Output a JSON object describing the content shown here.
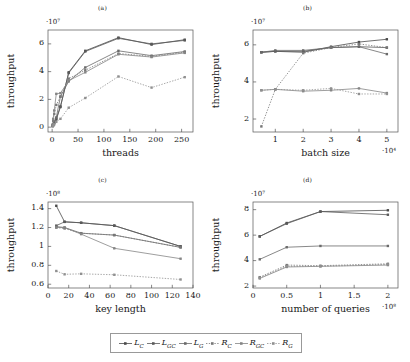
{
  "figure": {
    "ylabel": "throughput",
    "legend": {
      "items": [
        {
          "name": "L_C",
          "base": "L",
          "sub": "C",
          "color": "#4a4a4a",
          "dash": "none",
          "marker": "square"
        },
        {
          "name": "L_GC",
          "base": "L",
          "sub": "GC",
          "color": "#5a5a5a",
          "dash": "none",
          "marker": "square"
        },
        {
          "name": "L_G",
          "base": "L",
          "sub": "G",
          "color": "#6a6a6a",
          "dash": "none",
          "marker": "square"
        },
        {
          "name": "R_C",
          "base": "R",
          "sub": "C",
          "color": "#777777",
          "dash": "dotted",
          "marker": "square"
        },
        {
          "name": "R_GC",
          "base": "R",
          "sub": "GC",
          "color": "#858585",
          "dash": "none",
          "marker": "square"
        },
        {
          "name": "R_G",
          "base": "R",
          "sub": "G",
          "color": "#909090",
          "dash": "dotted",
          "marker": "square"
        }
      ]
    }
  },
  "chart_data": [
    {
      "id": "a",
      "type": "line",
      "title": "(a)",
      "xlabel": "threads",
      "ylabel": "throughput",
      "x_multiplier": "",
      "y_multiplier": "·10⁷",
      "xlim": [
        -8,
        272
      ],
      "ylim": [
        -0.35,
        7.0
      ],
      "xticks": [
        0,
        50,
        100,
        150,
        200,
        250
      ],
      "yticks": [
        0,
        2,
        4,
        6
      ],
      "x": [
        1,
        2,
        4,
        8,
        16,
        32,
        64,
        128,
        192,
        256
      ],
      "series": [
        {
          "name": "L_C",
          "values": [
            0.08,
            0.14,
            0.28,
            0.55,
            1.45,
            3.95,
            5.5,
            6.45,
            5.95,
            6.3
          ]
        },
        {
          "name": "L_GC",
          "values": [
            0.1,
            0.18,
            0.33,
            0.62,
            1.5,
            3.9,
            5.45,
            6.4,
            6.0,
            6.25
          ]
        },
        {
          "name": "L_G",
          "values": [
            0.12,
            0.2,
            0.4,
            0.7,
            2.2,
            3.3,
            4.3,
            5.5,
            5.15,
            5.45
          ]
        },
        {
          "name": "R_C",
          "values": [
            0.15,
            0.45,
            0.95,
            1.6,
            2.2,
            3.5,
            4.1,
            5.3,
            5.1,
            5.4
          ]
        },
        {
          "name": "R_GC",
          "values": [
            0.2,
            0.6,
            1.2,
            2.4,
            2.45,
            3.35,
            3.95,
            5.25,
            5.05,
            5.35
          ]
        },
        {
          "name": "R_G",
          "values": [
            0.05,
            0.1,
            0.2,
            0.38,
            0.6,
            1.4,
            2.1,
            3.65,
            2.85,
            3.6
          ]
        }
      ]
    },
    {
      "id": "b",
      "type": "line",
      "title": "(b)",
      "xlabel": "batch size",
      "ylabel": "throughput",
      "x_multiplier": "·10⁴",
      "y_multiplier": "·10⁷",
      "xlim": [
        0.2,
        5.4
      ],
      "ylim": [
        1.3,
        6.8
      ],
      "xticks": [
        1,
        2,
        3,
        4,
        5
      ],
      "yticks": [
        2,
        4,
        6
      ],
      "x": [
        0.5,
        1,
        2,
        3,
        4,
        5
      ],
      "series": [
        {
          "name": "L_C",
          "values": [
            5.6,
            5.65,
            5.6,
            5.9,
            6.15,
            6.3
          ]
        },
        {
          "name": "L_GC",
          "values": [
            5.6,
            5.65,
            5.65,
            5.85,
            5.9,
            5.85
          ]
        },
        {
          "name": "L_G",
          "values": [
            5.6,
            5.7,
            5.7,
            5.85,
            5.9,
            5.5
          ]
        },
        {
          "name": "R_C",
          "values": [
            1.6,
            3.6,
            5.55,
            5.85,
            6.05,
            5.85
          ]
        },
        {
          "name": "R_GC",
          "values": [
            3.55,
            3.6,
            3.5,
            3.55,
            3.65,
            3.4
          ]
        },
        {
          "name": "R_G",
          "values": [
            3.55,
            3.6,
            3.55,
            3.65,
            3.35,
            3.35
          ]
        }
      ]
    },
    {
      "id": "c",
      "type": "line",
      "title": "(c)",
      "xlabel": "key length",
      "ylabel": "throughput",
      "x_multiplier": "",
      "y_multiplier": "·10⁸",
      "xlim": [
        0,
        140
      ],
      "ylim": [
        0.56,
        1.47
      ],
      "xticks": [
        0,
        20,
        40,
        60,
        80,
        100,
        120,
        140
      ],
      "yticks": [
        0.6,
        0.8,
        1,
        1.2,
        1.4
      ],
      "x": [
        8,
        16,
        32,
        64,
        128
      ],
      "series": [
        {
          "name": "L_C",
          "values": [
            1.43,
            1.26,
            1.25,
            1.22,
            1.0
          ]
        },
        {
          "name": "L_GC",
          "values": [
            1.22,
            1.26,
            1.25,
            1.22,
            1.0
          ]
        },
        {
          "name": "L_G",
          "values": [
            1.21,
            1.2,
            1.14,
            1.12,
            0.99
          ]
        },
        {
          "name": "R_C",
          "values": [
            1.2,
            1.19,
            1.14,
            1.12,
            0.99
          ]
        },
        {
          "name": "R_GC",
          "values": [
            1.2,
            1.2,
            1.13,
            0.98,
            0.87
          ]
        },
        {
          "name": "R_G",
          "values": [
            0.74,
            0.705,
            0.71,
            0.7,
            0.65
          ]
        }
      ]
    },
    {
      "id": "d",
      "type": "line",
      "title": "(d)",
      "xlabel": "number of queries",
      "ylabel": "throughput",
      "x_multiplier": "·10⁸",
      "y_multiplier": "·10⁷",
      "xlim": [
        0,
        2.15
      ],
      "ylim": [
        1.85,
        8.6
      ],
      "xticks": [
        0,
        0.5,
        1,
        1.5,
        2
      ],
      "yticks": [
        2,
        4,
        6,
        8
      ],
      "x": [
        0.1,
        0.5,
        1.0,
        2.0
      ],
      "series": [
        {
          "name": "L_C",
          "values": [
            5.9,
            6.95,
            7.85,
            7.95
          ]
        },
        {
          "name": "L_GC",
          "values": [
            5.9,
            6.9,
            7.85,
            7.6
          ]
        },
        {
          "name": "L_G",
          "values": [
            4.1,
            5.05,
            5.15,
            5.15
          ]
        },
        {
          "name": "R_C",
          "values": [
            2.7,
            3.65,
            3.6,
            3.75
          ]
        },
        {
          "name": "R_GC",
          "values": [
            2.6,
            3.5,
            3.55,
            3.65
          ]
        },
        {
          "name": "R_G",
          "values": [
            2.65,
            3.55,
            3.55,
            3.7
          ]
        }
      ]
    }
  ]
}
